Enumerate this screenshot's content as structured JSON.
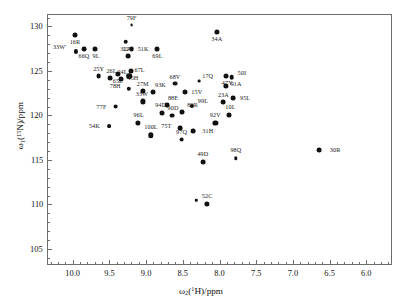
{
  "chart_data": {
    "type": "scatter",
    "title": "",
    "xlabel": "ω₂(¹H)/ppm",
    "ylabel": "ω₁(¹⁵N)/ppm",
    "xlim": [
      10.35,
      5.65
    ],
    "ylim": [
      131.4,
      103.2
    ],
    "x_inverted": true,
    "y_inverted": true,
    "grid": false,
    "legend": null,
    "xticks": [
      10.0,
      9.5,
      9.0,
      8.5,
      8.0,
      7.5,
      7.0,
      6.5,
      6.0
    ],
    "xticklabels": [
      "10.0",
      "9.5",
      "9.0",
      "8.5",
      "8.0",
      "7.5",
      "7.0",
      "6.5",
      "6.0"
    ],
    "x_minor_step": 0.1,
    "yticks": [
      105,
      110,
      115,
      120,
      125,
      130
    ],
    "yticklabels": [
      "105",
      "110",
      "115",
      "120",
      "125",
      "130"
    ],
    "y_minor_step": 1,
    "points": [
      {
        "label": "52C",
        "x": 8.18,
        "y": 110.2,
        "lx": 0,
        "ly": -7,
        "r": 2.6
      },
      {
        "label": "",
        "x": 8.33,
        "y": 110.6,
        "lx": 0,
        "ly": 0,
        "r": 1.2
      },
      {
        "label": "49D",
        "x": 8.24,
        "y": 114.9,
        "lx": 0,
        "ly": -7,
        "r": 2.4
      },
      {
        "label": "98Q",
        "x": 7.79,
        "y": 115.3,
        "lx": 0,
        "ly": -7,
        "r": 1.7
      },
      {
        "label": "30R",
        "x": 6.66,
        "y": 116.2,
        "lx": 13,
        "ly": 0,
        "r": 2.4
      },
      {
        "label": "100L",
        "x": 8.95,
        "y": 117.9,
        "lx": 0,
        "ly": -7,
        "r": 2.7
      },
      {
        "label": "97Q",
        "x": 8.53,
        "y": 117.4,
        "lx": 0,
        "ly": -7,
        "r": 2.4
      },
      {
        "label": "75T",
        "x": 8.55,
        "y": 118.7,
        "lx": -11,
        "ly": -1,
        "r": 2.4
      },
      {
        "label": "31H",
        "x": 8.37,
        "y": 118.4,
        "lx": 11,
        "ly": 0,
        "r": 2.4
      },
      {
        "label": "54K",
        "x": 9.52,
        "y": 118.9,
        "lx": -11,
        "ly": 0,
        "r": 1.9
      },
      {
        "label": "96L",
        "x": 9.13,
        "y": 119.3,
        "lx": 1,
        "ly": -7,
        "r": 2.6
      },
      {
        "label": "92V",
        "x": 8.07,
        "y": 119.3,
        "lx": 0,
        "ly": -7,
        "r": 2.6
      },
      {
        "label": "94D",
        "x": 8.8,
        "y": 120.4,
        "lx": -1,
        "ly": -7,
        "r": 2.5
      },
      {
        "label": "90D",
        "x": 8.66,
        "y": 120.1,
        "lx": 1,
        "ly": -7,
        "r": 2.4
      },
      {
        "label": "89R",
        "x": 8.52,
        "y": 120.5,
        "lx": 7,
        "ly": -6,
        "r": 2.5
      },
      {
        "label": "99L",
        "x": 8.39,
        "y": 121.2,
        "lx": 8,
        "ly": -4,
        "r": 2.1
      },
      {
        "label": "10L",
        "x": 7.88,
        "y": 120.2,
        "lx": 1,
        "ly": -7,
        "r": 2.5
      },
      {
        "label": "88E",
        "x": 8.73,
        "y": 121.3,
        "lx": 3,
        "ly": -6,
        "r": 2.4
      },
      {
        "label": "77F",
        "x": 9.43,
        "y": 121.1,
        "lx": -11,
        "ly": 0,
        "r": 2.4
      },
      {
        "label": "33W",
        "x": 9.06,
        "y": 121.7,
        "lx": -1,
        "ly": -6,
        "r": 2.6
      },
      {
        "label": "23A",
        "x": 7.96,
        "y": 121.6,
        "lx": 0,
        "ly": -6,
        "r": 2.4
      },
      {
        "label": "95L",
        "x": 7.83,
        "y": 122.1,
        "lx": 9,
        "ly": 0,
        "r": 2.4
      },
      {
        "label": "15V",
        "x": 8.48,
        "y": 122.7,
        "lx": 8,
        "ly": 0,
        "r": 2.5
      },
      {
        "label": "93K",
        "x": 8.92,
        "y": 122.8,
        "lx": 4,
        "ly": -6,
        "r": 2.5
      },
      {
        "label": "27M",
        "x": 9.06,
        "y": 122.9,
        "lx": 0,
        "ly": -6,
        "r": 2.6
      },
      {
        "label": "78H",
        "x": 9.25,
        "y": 123.1,
        "lx": -10,
        "ly": -2,
        "r": 2.2
      },
      {
        "label": "68V",
        "x": 8.62,
        "y": 123.7,
        "lx": 0,
        "ly": -6,
        "r": 2.4
      },
      {
        "label": "17Q",
        "x": 8.29,
        "y": 124.0,
        "lx": 5,
        "ly": -4,
        "r": 1.4
      },
      {
        "label": "91A",
        "x": 7.93,
        "y": 123.4,
        "lx": 7,
        "ly": -1,
        "r": 2.6
      },
      {
        "label": "50I",
        "x": 7.85,
        "y": 124.4,
        "lx": 8,
        "ly": -3,
        "r": 2.3
      },
      {
        "label": "47Y",
        "x": 7.92,
        "y": 124.6,
        "lx": 1,
        "ly": 6,
        "r": 2.5
      },
      {
        "label": "25Y",
        "x": 9.66,
        "y": 124.5,
        "lx": 0,
        "ly": -6,
        "r": 2.4
      },
      {
        "label": "26L",
        "x": 9.5,
        "y": 124.3,
        "lx": 1,
        "ly": -6,
        "r": 2.4
      },
      {
        "label": "24L",
        "x": 9.35,
        "y": 124.2,
        "lx": 1,
        "ly": -6,
        "r": 2.5
      },
      {
        "label": "67L",
        "x": 9.24,
        "y": 124.5,
        "lx": 7,
        "ly": -5,
        "r": 2.8
      },
      {
        "label": "65L",
        "x": 9.4,
        "y": 124.8,
        "lx": 0,
        "ly": 6,
        "r": 2.6
      },
      {
        "label": "45H",
        "x": 9.22,
        "y": 125.1,
        "lx": 2,
        "ly": 6,
        "r": 2.5
      },
      {
        "label": "12Y",
        "x": 9.26,
        "y": 126.8,
        "lx": 0,
        "ly": -6,
        "r": 2.4
      },
      {
        "label": "33W′",
        "x": 9.97,
        "y": 127.3,
        "lx": -11,
        "ly": -3,
        "r": 2.1
      },
      {
        "label": "66Q",
        "x": 9.86,
        "y": 127.6,
        "lx": 0,
        "ly": 6,
        "r": 2.4
      },
      {
        "label": "9L",
        "x": 9.71,
        "y": 127.6,
        "lx": 1,
        "ly": 6,
        "r": 2.5
      },
      {
        "label": "51K",
        "x": 9.21,
        "y": 127.6,
        "lx": 8,
        "ly": 0,
        "r": 2.4
      },
      {
        "label": "69L",
        "x": 8.86,
        "y": 127.6,
        "lx": 0,
        "ly": 6,
        "r": 2.5
      },
      {
        "label": "32A",
        "x": 9.29,
        "y": 128.4,
        "lx": 0,
        "ly": 6,
        "r": 2.3
      },
      {
        "label": "16R",
        "x": 9.98,
        "y": 129.2,
        "lx": 0,
        "ly": 6,
        "r": 2.5
      },
      {
        "label": "79F",
        "x": 9.21,
        "y": 130.3,
        "lx": 0,
        "ly": -6,
        "r": 1.4
      },
      {
        "label": "34A",
        "x": 8.05,
        "y": 129.5,
        "lx": 0,
        "ly": 6,
        "r": 2.6
      }
    ]
  },
  "axes": {
    "x_axis_title": "ω",
    "x_axis_sub": "2",
    "x_axis_paren": "(",
    "x_axis_sup": "1",
    "x_axis_nucleus": "H",
    "x_axis_tail": ")/ppm",
    "y_axis_title": "ω",
    "y_axis_sub": "1",
    "y_axis_paren": "(",
    "y_axis_sup": "15",
    "y_axis_nucleus": "N",
    "y_axis_tail": ")/ppm"
  },
  "style": {
    "frame_color": "#6d6d6d",
    "peak_color": "#111111",
    "label_color": "#1a1a1a",
    "background": "#ffffff"
  }
}
